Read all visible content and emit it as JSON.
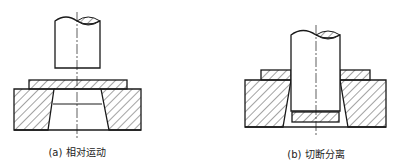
{
  "figures": [
    {
      "id": "a",
      "caption": "(a) 相对运动",
      "caption_x": 77,
      "caption_y": 144,
      "parts": [
        "punch",
        "sheet-strip",
        "die"
      ]
    },
    {
      "id": "b",
      "caption": "(b) 切断分离",
      "caption_x": 316,
      "caption_y": 146,
      "parts": [
        "punch",
        "sheet-strip-left",
        "sheet-strip-right",
        "die",
        "slug"
      ]
    }
  ],
  "colors": {
    "line": "#1a1a1a",
    "hatch": "#333333",
    "background": "#ffffff"
  }
}
